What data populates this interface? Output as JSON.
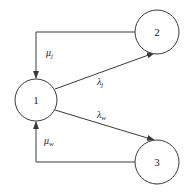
{
  "diagram": {
    "nodes": [
      {
        "id": "1",
        "label": "1",
        "cx": 36,
        "cy": 100,
        "r": 21
      },
      {
        "id": "2",
        "label": "2",
        "cx": 157,
        "cy": 32,
        "r": 22
      },
      {
        "id": "3",
        "label": "3",
        "cx": 157,
        "cy": 162,
        "r": 22
      }
    ],
    "edges": [
      {
        "from": "2",
        "to": "1",
        "symbol": "μ",
        "subscript": "j"
      },
      {
        "from": "1",
        "to": "2",
        "symbol": "λ",
        "subscript": "j"
      },
      {
        "from": "1",
        "to": "3",
        "symbol": "λ",
        "subscript": "w"
      },
      {
        "from": "3",
        "to": "1",
        "symbol": "μ",
        "subscript": "w"
      }
    ],
    "colors": {
      "stroke": "#3a3a3a",
      "text": "#222222",
      "background": "#ffffff"
    }
  }
}
